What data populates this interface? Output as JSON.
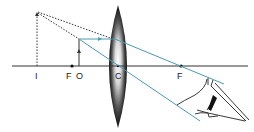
{
  "diagram": {
    "labels": {
      "image": "I",
      "focal_left": "F",
      "object": "O",
      "center": "C",
      "focal_right": "F"
    },
    "colors": {
      "axis": "#333333",
      "ray": "#4a9bb0",
      "dotted": "#333333",
      "lens_dark": "#111111",
      "lens_light": "#ffffff",
      "eye": "#222222"
    }
  }
}
